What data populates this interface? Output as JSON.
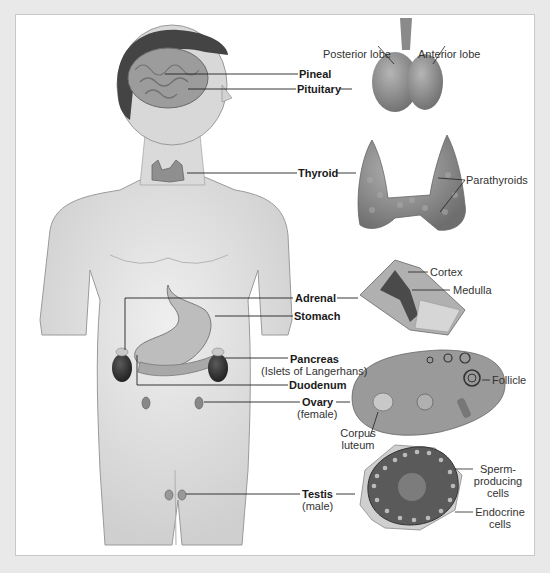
{
  "diagram": {
    "colors": {
      "background": "#e9e9e9",
      "panel": "#ffffff",
      "skin": "#dcdcdc",
      "organ": "#8a8a8a",
      "line": "#222222"
    },
    "body_labels": {
      "pineal": "Pineal",
      "pituitary": "Pituitary",
      "thyroid": "Thyroid",
      "adrenal": "Adrenal",
      "stomach": "Stomach",
      "pancreas": "Pancreas",
      "pancreas_sub": "(Islets of Langerhans)",
      "duodenum": "Duodenum",
      "ovary": "Ovary",
      "ovary_sub": "(female)",
      "testis": "Testis",
      "testis_sub": "(male)"
    },
    "detail_labels": {
      "posterior_lobe": "Posterior lobe",
      "anterior_lobe": "Anterior lobe",
      "parathyroids": "Parathyroids",
      "cortex": "Cortex",
      "medulla": "Medulla",
      "follicle": "Follicle",
      "corpus_luteum_1": "Corpus",
      "corpus_luteum_2": "luteum",
      "sperm_cells_1": "Sperm-",
      "sperm_cells_2": "producing",
      "sperm_cells_3": "cells",
      "endocrine_cells_1": "Endocrine",
      "endocrine_cells_2": "cells"
    }
  }
}
